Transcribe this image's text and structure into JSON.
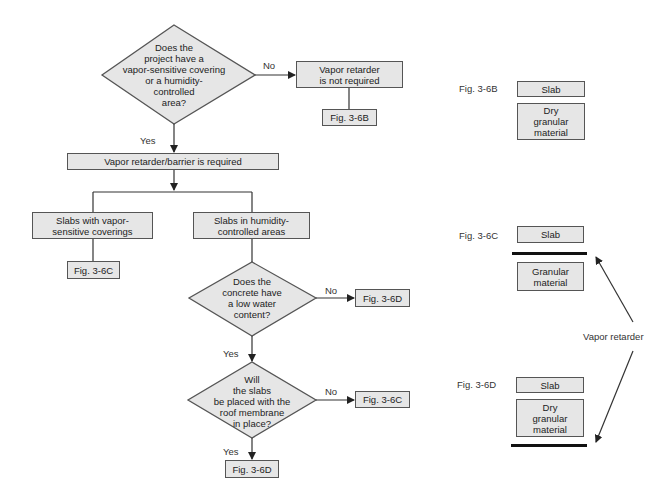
{
  "flowchart": {
    "decision1": {
      "text": "Does the project have a vapor-sensitive covering or a humidity-controlled area?",
      "lines": [
        "Does the",
        "project have a",
        "vapor-sensitive covering",
        "or a humidity-",
        "controlled",
        "area?"
      ],
      "no_label": "No",
      "yes_label": "Yes"
    },
    "not_required": {
      "lines": [
        "Vapor retarder",
        "is not required"
      ]
    },
    "fig_6b_ref": "Fig. 3-6B",
    "required": "Vapor retarder/barrier is required",
    "branch_left": {
      "lines": [
        "Slabs with vapor-",
        "sensitive coverings"
      ]
    },
    "branch_right": {
      "lines": [
        "Slabs in humidity-",
        "controlled areas"
      ]
    },
    "fig_6c_left_ref": "Fig. 3-6C",
    "decision2": {
      "lines": [
        "Does the",
        "concrete have",
        "a low water",
        "content?"
      ],
      "no_label": "No",
      "yes_label": "Yes"
    },
    "fig_6d_no_ref": "Fig. 3-6D",
    "decision3": {
      "lines": [
        "Will",
        "the slabs",
        "be placed with the",
        "roof membrane",
        "in place?"
      ],
      "no_label": "No",
      "yes_label": "Yes"
    },
    "fig_6c_no_ref": "Fig. 3-6C",
    "fig_6d_yes_ref": "Fig. 3-6D"
  },
  "figures": {
    "fig_6b": {
      "label": "Fig. 3-6B",
      "slab": "Slab",
      "base": [
        "Dry",
        "granular",
        "material"
      ]
    },
    "fig_6c": {
      "label": "Fig. 3-6C",
      "slab": "Slab",
      "base": [
        "Granular",
        "material"
      ]
    },
    "fig_6d": {
      "label": "Fig. 3-6D",
      "slab": "Slab",
      "base": [
        "Dry",
        "granular",
        "material"
      ]
    },
    "vapor_retarder_label": "Vapor retarder"
  },
  "colors": {
    "fill": "#e6e6e6",
    "stroke": "#555555",
    "text": "#222222",
    "retarder": "#111111"
  }
}
